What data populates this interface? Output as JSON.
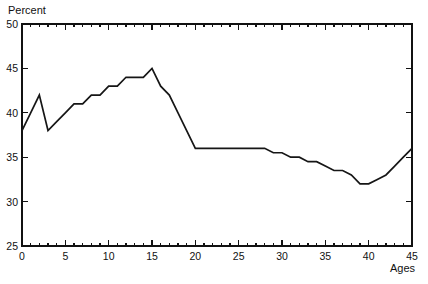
{
  "chart_data": {
    "type": "line",
    "title": "",
    "subtitle": "",
    "xlabel": "Ages",
    "ylabel": "Percent",
    "xlim": [
      0,
      45
    ],
    "ylim": [
      25,
      50
    ],
    "grid": false,
    "legend": null,
    "legend_position": "none",
    "x_ticks": [
      0,
      5,
      10,
      15,
      20,
      25,
      30,
      35,
      40,
      45
    ],
    "x_tick_labels": [
      "0",
      "5",
      "10",
      "15",
      "20",
      "25",
      "30",
      "35",
      "40",
      "45"
    ],
    "x_minor_tick_step": 1,
    "y_ticks": [
      25,
      30,
      35,
      40,
      45,
      50
    ],
    "y_tick_labels": [
      "25",
      "30",
      "35",
      "40",
      "45",
      "50"
    ],
    "series": [
      {
        "name": "Percent",
        "color": "#161616",
        "x": [
          0,
          1,
          2,
          3,
          4,
          5,
          6,
          7,
          8,
          9,
          10,
          11,
          12,
          13,
          14,
          15,
          16,
          17,
          18,
          19,
          20,
          21,
          22,
          23,
          24,
          25,
          26,
          27,
          28,
          29,
          30,
          31,
          32,
          33,
          34,
          35,
          36,
          37,
          38,
          39,
          40,
          41,
          42,
          43,
          44,
          45
        ],
        "values": [
          38,
          40,
          42,
          38,
          39,
          40,
          41,
          41,
          42,
          42,
          43,
          43,
          44,
          44,
          44,
          45,
          43,
          42,
          40,
          38,
          36,
          36,
          36,
          36,
          36,
          36,
          36,
          36,
          36,
          35.5,
          35.5,
          35,
          35,
          34.5,
          34.5,
          34,
          33.5,
          33.5,
          33,
          32,
          32,
          32.5,
          33,
          34,
          35,
          36
        ]
      }
    ]
  },
  "labels": {
    "y_axis_title": "Percent",
    "x_axis_title": "Ages"
  }
}
